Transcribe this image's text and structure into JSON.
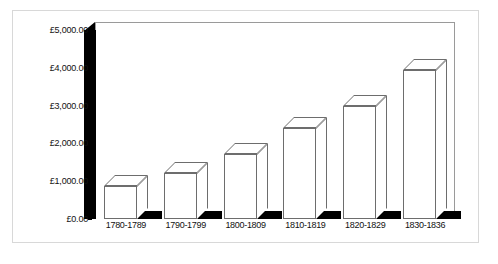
{
  "chart_data": {
    "type": "bar",
    "title": "",
    "xlabel": "",
    "ylabel": "",
    "categories": [
      "1780-1789",
      "1790-1799",
      "1800-1809",
      "1810-1819",
      "1820-1829",
      "1830-1836"
    ],
    "values": [
      880,
      1230,
      1730,
      2420,
      2980,
      3940
    ],
    "ylim": [
      0,
      5000
    ],
    "ytick_labels": [
      "£0.00",
      "£1,000.00",
      "£2,000.00",
      "£3,000.00",
      "£4,000.00",
      "£5,000.00"
    ],
    "ytick_values": [
      0,
      1000,
      2000,
      3000,
      4000,
      5000
    ],
    "grid": false,
    "legend": "none",
    "style": "3d-column-white-bars-black-wall",
    "currency_symbol": "£"
  },
  "caption": {
    "text": ""
  },
  "colors": {
    "bar_fill": "#ffffff",
    "bar_outline": "#6d6d6d",
    "axis_wall": "#000000",
    "plot_border": "#9a9a9a",
    "outer_border": "#d8d8d8",
    "background": "#ffffff",
    "text": "#111111"
  }
}
